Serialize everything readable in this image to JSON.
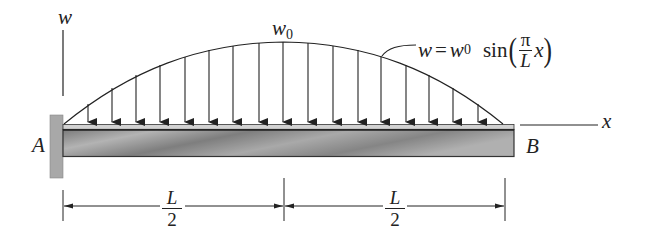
{
  "diagram": {
    "type": "cantilever-beam-distributed-load",
    "labels": {
      "w_axis": "w",
      "x_axis": "x",
      "peak_load": "w",
      "peak_load_sub": "0",
      "support_A": "A",
      "end_B": "B"
    },
    "equation": {
      "lhs": "w",
      "equals": "=",
      "coef": "w",
      "coef_sub": "0",
      "func": "sin",
      "open_paren": "(",
      "frac_num": "π",
      "frac_den": "L",
      "var": "x",
      "close_paren": ")"
    },
    "dimensions": [
      {
        "num": "L",
        "den": "2"
      },
      {
        "num": "L",
        "den": "2"
      }
    ],
    "load_arrow_count": 17,
    "colors": {
      "ink": "#222222",
      "wall": "#a8a8a8",
      "beam_body": "#8c8c8c",
      "beam_top_strip": "#cfcfcf"
    }
  }
}
